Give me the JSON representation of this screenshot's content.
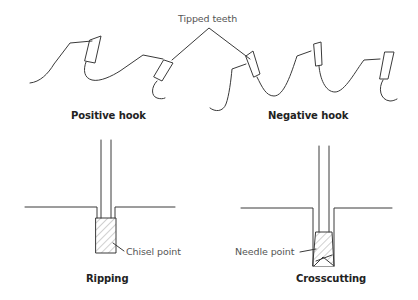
{
  "diagram": {
    "top_panel": {
      "callout": "Tipped teeth",
      "left_caption": "Positive hook",
      "right_caption": "Negative hook"
    },
    "bottom_panel": {
      "left": {
        "caption": "Ripping",
        "callout": "Chisel point"
      },
      "right": {
        "caption": "Crosscutting",
        "callout": "Needle point"
      }
    },
    "colors": {
      "line": "#3a3a3a",
      "hatch": "#8a8a8a",
      "background": "#ffffff"
    }
  }
}
